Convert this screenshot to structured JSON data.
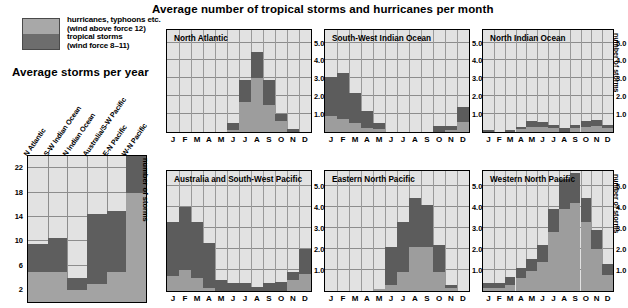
{
  "titles": {
    "main": "Average number of tropical storms and hurricanes per month",
    "left": "Average storms per year"
  },
  "legend": {
    "items": [
      {
        "label_line1": "hurricanes, typhoons etc.",
        "label_line2": "(wind above force 12)",
        "color": "#a8a8a8",
        "key": "hurricanes"
      },
      {
        "label_line1": "tropical storms",
        "label_line2": "(wind force 8–11)",
        "color": "#6d6d6d",
        "key": "tropical_storms"
      }
    ]
  },
  "axis_labels": {
    "number_of_storms": "number of storms"
  },
  "chart_data": [
    {
      "id": "average-storms-per-year",
      "type": "bar",
      "title": "Average storms per year",
      "xlabel": "",
      "ylabel": "number of storms",
      "ylim": [
        0,
        24
      ],
      "yticks": [
        2,
        6,
        10,
        14,
        18,
        22
      ],
      "grid": true,
      "stacked": true,
      "categories": [
        "N Atlantic",
        "S-W Indian Ocean",
        "N Indian Ocean",
        "Australia/S-W Pacific",
        "E-N Pacific",
        "W-N Pacific"
      ],
      "series": [
        {
          "name": "hurricanes, typhoons etc. (wind above force 12)",
          "color": "#a3a3a3",
          "values": [
            5.0,
            5.0,
            2.0,
            3.0,
            5.0,
            18.0
          ]
        },
        {
          "name": "tropical storms (wind force 8–11)",
          "color": "#5e5e5e",
          "values": [
            4.5,
            5.5,
            2.0,
            11.5,
            10.0,
            6.0
          ]
        }
      ],
      "totals": [
        9.5,
        10.5,
        4.0,
        14.5,
        15.0,
        24.0
      ]
    },
    {
      "id": "north-atlantic",
      "type": "bar",
      "title": "North Atlantic",
      "ylabel": "number of storms",
      "ylim": [
        0,
        5.7
      ],
      "yticks": [
        "1.0",
        "2.0",
        "3.0",
        "4.0",
        "5.0"
      ],
      "grid": true,
      "stacked": true,
      "categories": [
        "J",
        "F",
        "M",
        "A",
        "M",
        "J",
        "J",
        "A",
        "S",
        "O",
        "N",
        "D"
      ],
      "series": [
        {
          "name": "hurricanes",
          "color": "#9d9d9d",
          "values": [
            0.0,
            0.0,
            0.0,
            0.0,
            0.0,
            0.1,
            1.7,
            3.0,
            1.5,
            0.6,
            0.0,
            0.0
          ]
        },
        {
          "name": "tropical storms",
          "color": "#5c5c5c",
          "values": [
            0.0,
            0.0,
            0.0,
            0.0,
            0.0,
            0.4,
            1.2,
            1.5,
            1.4,
            0.4,
            0.15,
            0.0
          ]
        }
      ],
      "totals": [
        0.0,
        0.0,
        0.0,
        0.0,
        0.0,
        0.5,
        2.9,
        4.5,
        2.9,
        1.0,
        0.15,
        0.0
      ]
    },
    {
      "id": "south-west-indian-ocean",
      "type": "bar",
      "title": "South-West Indian Ocean",
      "ylabel": "number of storms",
      "ylim": [
        0,
        5.7
      ],
      "yticks": [
        "1.0",
        "2.0",
        "3.0",
        "4.0",
        "5.0"
      ],
      "grid": true,
      "stacked": true,
      "categories": [
        "J",
        "F",
        "M",
        "A",
        "M",
        "J",
        "J",
        "A",
        "S",
        "O",
        "N",
        "D"
      ],
      "series": [
        {
          "name": "hurricanes",
          "color": "#9d9d9d",
          "values": [
            0.9,
            0.7,
            0.5,
            0.25,
            0.15,
            0.0,
            0.0,
            0.0,
            0.0,
            0.0,
            0.1,
            0.55
          ]
        },
        {
          "name": "tropical storms",
          "color": "#5c5c5c",
          "values": [
            2.2,
            2.6,
            1.7,
            0.95,
            0.35,
            0.0,
            0.0,
            0.0,
            0.0,
            0.35,
            0.25,
            0.85
          ]
        }
      ],
      "totals": [
        3.1,
        3.3,
        2.2,
        1.2,
        0.5,
        0.0,
        0.0,
        0.0,
        0.0,
        0.35,
        0.35,
        1.4
      ]
    },
    {
      "id": "north-indian-ocean",
      "type": "bar",
      "title": "North Indian Ocean",
      "ylabel": "number of storms",
      "ylim": [
        0,
        5.7
      ],
      "yticks": [
        "1.0",
        "2.0",
        "3.0",
        "4.0",
        "5.0"
      ],
      "grid": true,
      "stacked": true,
      "categories": [
        "J",
        "F",
        "M",
        "A",
        "M",
        "J",
        "J",
        "A",
        "S",
        "O",
        "N",
        "D"
      ],
      "series": [
        {
          "name": "hurricanes",
          "color": "#9d9d9d",
          "values": [
            0.0,
            0.0,
            0.0,
            0.15,
            0.3,
            0.3,
            0.25,
            0.0,
            0.2,
            0.3,
            0.35,
            0.2
          ]
        },
        {
          "name": "tropical storms",
          "color": "#5c5c5c",
          "values": [
            0.1,
            0.0,
            0.1,
            0.15,
            0.3,
            0.25,
            0.15,
            0.25,
            0.2,
            0.3,
            0.35,
            0.2
          ]
        }
      ],
      "totals": [
        0.1,
        0.0,
        0.1,
        0.3,
        0.6,
        0.55,
        0.4,
        0.25,
        0.4,
        0.6,
        0.7,
        0.4
      ]
    },
    {
      "id": "australia-and-south-west-pacific",
      "type": "bar",
      "title": "Australia and South-West Pacific",
      "ylabel": "number of storms",
      "ylim": [
        0,
        5.7
      ],
      "yticks": [
        "1.0",
        "2.0",
        "3.0",
        "4.0",
        "5.0"
      ],
      "grid": true,
      "stacked": true,
      "categories": [
        "J",
        "F",
        "M",
        "A",
        "M",
        "J",
        "J",
        "A",
        "S",
        "O",
        "N",
        "D"
      ],
      "series": [
        {
          "name": "hurricanes",
          "color": "#9d9d9d",
          "values": [
            0.7,
            1.0,
            0.6,
            0.15,
            0.0,
            0.0,
            0.0,
            0.0,
            0.0,
            0.0,
            0.5,
            0.8
          ]
        },
        {
          "name": "tropical storms",
          "color": "#5c5c5c",
          "values": [
            2.6,
            3.0,
            2.7,
            2.15,
            0.5,
            0.4,
            0.4,
            0.2,
            0.4,
            0.45,
            0.4,
            1.2
          ]
        }
      ],
      "totals": [
        3.3,
        4.0,
        3.3,
        2.3,
        0.5,
        0.4,
        0.4,
        0.2,
        0.4,
        0.45,
        0.9,
        2.0
      ]
    },
    {
      "id": "eastern-north-pacific",
      "type": "bar",
      "title": "Eastern North Pacific",
      "ylabel": "number of storms",
      "ylim": [
        0,
        5.7
      ],
      "yticks": [
        "1.0",
        "2.0",
        "3.0",
        "4.0",
        "5.0"
      ],
      "grid": true,
      "stacked": true,
      "categories": [
        "J",
        "F",
        "M",
        "A",
        "M",
        "J",
        "J",
        "A",
        "S",
        "O",
        "N",
        "D"
      ],
      "series": [
        {
          "name": "hurricanes",
          "color": "#9d9d9d",
          "values": [
            0.0,
            0.0,
            0.0,
            0.0,
            0.1,
            0.3,
            0.9,
            2.1,
            2.1,
            0.9,
            0.15,
            0.0
          ]
        },
        {
          "name": "tropical storms",
          "color": "#5c5c5c",
          "values": [
            0.0,
            0.0,
            0.0,
            0.0,
            0.0,
            1.8,
            2.4,
            2.3,
            2.0,
            1.3,
            0.15,
            0.0
          ]
        }
      ],
      "totals": [
        0.0,
        0.0,
        0.0,
        0.0,
        0.1,
        2.1,
        3.3,
        4.4,
        4.1,
        2.2,
        0.3,
        0.0
      ]
    },
    {
      "id": "western-north-pacific",
      "type": "bar",
      "title": "Western North Pacific",
      "ylabel": "number of storms",
      "ylim": [
        0,
        5.7
      ],
      "yticks": [
        "1.0",
        "2.0",
        "3.0",
        "4.0",
        "5.0"
      ],
      "grid": true,
      "stacked": true,
      "categories": [
        "J",
        "F",
        "M",
        "A",
        "M",
        "J",
        "J",
        "A",
        "S",
        "O",
        "N",
        "D"
      ],
      "series": [
        {
          "name": "hurricanes",
          "color": "#9d9d9d",
          "values": [
            0.15,
            0.15,
            0.3,
            0.6,
            0.95,
            1.4,
            2.8,
            3.9,
            4.2,
            3.3,
            2.0,
            0.75
          ]
        },
        {
          "name": "tropical storms",
          "color": "#5c5c5c",
          "values": [
            0.25,
            0.25,
            0.35,
            0.5,
            0.55,
            0.8,
            1.1,
            1.4,
            1.4,
            1.1,
            0.9,
            0.55
          ]
        }
      ],
      "totals": [
        0.4,
        0.4,
        0.65,
        1.1,
        1.5,
        2.2,
        3.9,
        5.3,
        5.6,
        4.4,
        2.9,
        1.3
      ]
    }
  ]
}
